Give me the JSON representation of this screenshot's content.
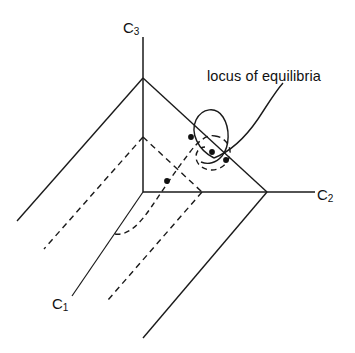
{
  "figure": {
    "title_text": "",
    "background_color": "#ffffff",
    "stroke_color": "#1a1a1a",
    "width": 355,
    "height": 353,
    "axes": [
      {
        "id": "c3",
        "label_main": "C",
        "label_sub": "3",
        "name": "axis-label-c3"
      },
      {
        "id": "c2",
        "label_main": "C",
        "label_sub": "2",
        "name": "axis-label-c2"
      },
      {
        "id": "c1",
        "label_main": "C",
        "label_sub": "1",
        "name": "axis-label-c1"
      }
    ],
    "annotations": [
      {
        "id": "locus",
        "text": "locus of equilibria",
        "name": "annotation-locus-of-equilibria"
      }
    ],
    "equilibrium_points": [
      {
        "id": "p1",
        "x": 167,
        "y": 181
      },
      {
        "id": "p2",
        "x": 191,
        "y": 137
      },
      {
        "id": "p3",
        "x": 212,
        "y": 152
      },
      {
        "id": "p4",
        "x": 226,
        "y": 160
      }
    ],
    "geometry": {
      "apex": {
        "x": 143,
        "y": 78
      },
      "origin": {
        "x": 143,
        "y": 192
      },
      "inner_apex": {
        "x": 143,
        "y": 137
      },
      "outer_right_vertex": {
        "x": 267,
        "y": 192
      },
      "inner_right_vertex": {
        "x": 202,
        "y": 192
      },
      "c2_axis_end": {
        "x": 315,
        "y": 192
      },
      "c3_axis_top": {
        "x": 143,
        "y": 37
      },
      "c1_axis_end": {
        "x": 73,
        "y": 296
      }
    }
  }
}
